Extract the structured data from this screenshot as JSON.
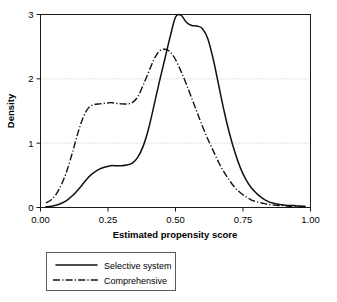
{
  "chart_data": {
    "type": "line",
    "title": "",
    "subtitle": "",
    "xlabel": "Estimated propensity score",
    "ylabel": "Density",
    "xlim": [
      0.0,
      1.0
    ],
    "ylim": [
      0.0,
      3.0
    ],
    "xticks": [
      "0.00",
      "0.25",
      "0.50",
      "0.75",
      "1.00"
    ],
    "xtick_values": [
      0.0,
      0.25,
      0.5,
      0.75,
      1.0
    ],
    "yticks": [
      "0",
      "1",
      "2",
      "3"
    ],
    "ytick_values": [
      0,
      1,
      2,
      3
    ],
    "grid": true,
    "grid_axis": "y",
    "legend_position": "below-plot",
    "series": [
      {
        "name": "Selective system",
        "style": "solid",
        "color": "#111111",
        "x": [
          0.02,
          0.04,
          0.06,
          0.08,
          0.1,
          0.12,
          0.14,
          0.16,
          0.18,
          0.2,
          0.22,
          0.24,
          0.26,
          0.28,
          0.3,
          0.32,
          0.34,
          0.36,
          0.38,
          0.4,
          0.42,
          0.44,
          0.46,
          0.48,
          0.5,
          0.52,
          0.54,
          0.56,
          0.58,
          0.6,
          0.62,
          0.64,
          0.66,
          0.68,
          0.7,
          0.72,
          0.74,
          0.76,
          0.78,
          0.8,
          0.82,
          0.84,
          0.86,
          0.88,
          0.9,
          0.92,
          0.94,
          0.96,
          0.98
        ],
        "y": [
          0.01,
          0.02,
          0.04,
          0.07,
          0.12,
          0.19,
          0.28,
          0.38,
          0.48,
          0.55,
          0.6,
          0.63,
          0.65,
          0.65,
          0.65,
          0.66,
          0.69,
          0.78,
          0.95,
          1.22,
          1.58,
          1.95,
          2.3,
          2.65,
          2.96,
          2.99,
          2.88,
          2.83,
          2.82,
          2.78,
          2.62,
          2.3,
          1.9,
          1.5,
          1.15,
          0.86,
          0.62,
          0.44,
          0.31,
          0.22,
          0.15,
          0.1,
          0.07,
          0.05,
          0.04,
          0.03,
          0.03,
          0.02,
          0.02
        ]
      },
      {
        "name": "Comprehensive",
        "style": "dash-dot",
        "color": "#111111",
        "x": [
          0.02,
          0.04,
          0.06,
          0.08,
          0.1,
          0.12,
          0.14,
          0.16,
          0.18,
          0.2,
          0.22,
          0.24,
          0.26,
          0.28,
          0.3,
          0.32,
          0.34,
          0.36,
          0.38,
          0.4,
          0.42,
          0.44,
          0.46,
          0.48,
          0.5,
          0.52,
          0.54,
          0.56,
          0.58,
          0.6,
          0.62,
          0.64,
          0.66,
          0.68,
          0.7,
          0.72,
          0.74,
          0.76,
          0.78,
          0.8,
          0.82,
          0.84,
          0.86,
          0.88,
          0.9,
          0.92,
          0.94,
          0.96,
          0.98
        ],
        "y": [
          0.07,
          0.12,
          0.22,
          0.38,
          0.6,
          0.88,
          1.18,
          1.42,
          1.56,
          1.6,
          1.61,
          1.62,
          1.63,
          1.62,
          1.61,
          1.61,
          1.63,
          1.72,
          1.9,
          2.1,
          2.3,
          2.43,
          2.46,
          2.42,
          2.3,
          2.12,
          1.92,
          1.7,
          1.48,
          1.26,
          1.06,
          0.88,
          0.7,
          0.55,
          0.42,
          0.31,
          0.23,
          0.17,
          0.12,
          0.09,
          0.07,
          0.05,
          0.04,
          0.03,
          0.03,
          0.02,
          0.02,
          0.02,
          0.01
        ]
      }
    ]
  },
  "axes": {
    "xlabel": "Estimated propensity score",
    "ylabel": "Density",
    "xticks": [
      {
        "label": "0.00",
        "value": 0.0
      },
      {
        "label": "0.25",
        "value": 0.25
      },
      {
        "label": "0.50",
        "value": 0.5
      },
      {
        "label": "0.75",
        "value": 0.75
      },
      {
        "label": "1.00",
        "value": 1.0
      }
    ],
    "yticks": [
      {
        "label": "0",
        "value": 0
      },
      {
        "label": "1",
        "value": 1
      },
      {
        "label": "2",
        "value": 2
      },
      {
        "label": "3",
        "value": 3
      }
    ]
  },
  "legend": {
    "entries": [
      {
        "label": "Selective system",
        "style": "solid"
      },
      {
        "label": "Comprehensive",
        "style": "dash-dot"
      }
    ]
  },
  "colors": {
    "line": "#111111",
    "grid": "#b9b9b9",
    "frame": "#1a1a1a",
    "legend_border": "#5a5a5a",
    "background": "#ffffff"
  }
}
